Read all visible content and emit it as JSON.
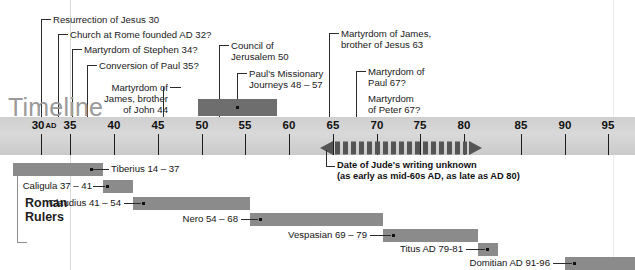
{
  "title": "Timeline",
  "axis": {
    "start_year": 30,
    "end_year": 95,
    "step": 5,
    "ticks": [
      {
        "label": "30",
        "suffix": "AD",
        "year": 30
      },
      {
        "label": "35",
        "suffix": "",
        "year": 35
      },
      {
        "label": "40",
        "suffix": "",
        "year": 40
      },
      {
        "label": "45",
        "suffix": "",
        "year": 45
      },
      {
        "label": "50",
        "suffix": "",
        "year": 50
      },
      {
        "label": "55",
        "suffix": "",
        "year": 55
      },
      {
        "label": "60",
        "suffix": "",
        "year": 60
      },
      {
        "label": "65",
        "suffix": "",
        "year": 65
      },
      {
        "label": "70",
        "suffix": "",
        "year": 70
      },
      {
        "label": "75",
        "suffix": "",
        "year": 75
      },
      {
        "label": "80",
        "suffix": "",
        "year": 80
      },
      {
        "label": "85",
        "suffix": "",
        "year": 85
      },
      {
        "label": "90",
        "suffix": "",
        "year": 90
      },
      {
        "label": "95",
        "suffix": "",
        "year": 95
      }
    ]
  },
  "events": [
    {
      "id": "resurrection",
      "text": "Resurrection of Jesus 30",
      "year": 30
    },
    {
      "id": "church-rome",
      "text": "Church at Rome founded AD 32?",
      "year": 32
    },
    {
      "id": "stephen",
      "text": "Martyrdom of Stephen 34?",
      "year": 34
    },
    {
      "id": "conversion-paul",
      "text": "Conversion of Paul 35?",
      "year": 35
    },
    {
      "id": "james-john",
      "text": "Martyrdom of\nJames, brother\nof John 44",
      "year": 44
    },
    {
      "id": "council-jerusalem",
      "text": "Council of\nJerusalem 50",
      "year": 50
    },
    {
      "id": "paul-journeys",
      "text": "Paul's Missionary\nJourneys 48 – 57",
      "year_start": 48,
      "year_end": 57
    },
    {
      "id": "james-jesus",
      "text": "Martyrdom of James,\nbrother of Jesus 63",
      "year": 63
    },
    {
      "id": "paul-martyrdom",
      "text": "Martyrdom of\nPaul 67?",
      "year": 67
    },
    {
      "id": "peter-martyrdom",
      "text": "Martyrdom\nof Peter 67?",
      "year": 67
    }
  ],
  "jude": {
    "note": "Date of Jude's writing unknown\n(as early as mid-60s AD, as late as AD 80)",
    "year_start": 62,
    "year_end": 80
  },
  "rulers_section_title": "Roman\nRulers",
  "rulers": [
    {
      "id": "tiberius",
      "label": "Tiberius 14 – 37",
      "year_start": 14,
      "year_end": 37,
      "label_side": "right"
    },
    {
      "id": "caligula",
      "label": "Caligula 37 – 41",
      "year_start": 37,
      "year_end": 41,
      "label_side": "left"
    },
    {
      "id": "claudius",
      "label": "Claudius 41 – 54",
      "year_start": 41,
      "year_end": 54,
      "label_side": "left"
    },
    {
      "id": "nero",
      "label": "Nero 54 – 68",
      "year_start": 54,
      "year_end": 68,
      "label_side": "left"
    },
    {
      "id": "vespasian",
      "label": "Vespasian 69 – 79",
      "year_start": 69,
      "year_end": 79,
      "label_side": "left"
    },
    {
      "id": "titus",
      "label": "Titus AD 79-81",
      "year_start": 79,
      "year_end": 81,
      "label_side": "left"
    },
    {
      "id": "domitian",
      "label": "Domitian AD 91-96",
      "year_start": 91,
      "year_end": 96,
      "label_side": "left"
    }
  ],
  "colors": {
    "band": "#d4d4d4",
    "bar": "#8b8b8b",
    "mission_bar": "#6e6e6e",
    "title_gray": "#9a9a9a",
    "text": "#1a1a1a"
  }
}
